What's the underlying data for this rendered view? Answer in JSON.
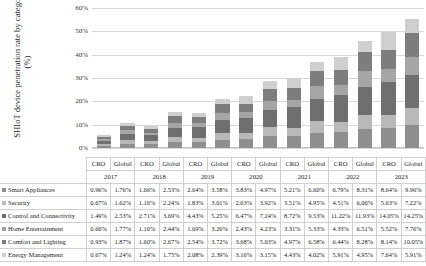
{
  "chart_data": {
    "type": "bar",
    "subtype": "stacked-column",
    "title": "",
    "xlabel": "",
    "ylabel": "SHIoT device penetration rate by categories (%)",
    "ylim": [
      0,
      60
    ],
    "ytick_labels": [
      "0%",
      "10%",
      "20%",
      "30%",
      "40%",
      "50%",
      "60%"
    ],
    "ytick_values": [
      0,
      10,
      20,
      30,
      40,
      50,
      60
    ],
    "grid": true,
    "legend_position": "table-row-labels",
    "years": [
      "2017",
      "2018",
      "2019",
      "2020",
      "2021",
      "2022",
      "2023"
    ],
    "group_labels": [
      "CRO",
      "Global"
    ],
    "categories": [
      "CRO 2017",
      "Global 2017",
      "CRO 2018",
      "Global 2018",
      "CRO 2019",
      "Global 2019",
      "CRO 2020",
      "Global 2020",
      "CRO 2021",
      "Global 2021",
      "CRO 2022",
      "Global 2022",
      "CRO 2023",
      "Global 2023"
    ],
    "series": [
      {
        "name": "Smart Appliances",
        "color": "#8e8e8e",
        "values": [
          0.96,
          1.76,
          1.66,
          2.53,
          2.64,
          3.58,
          3.83,
          4.97,
          5.21,
          6.6,
          6.79,
          8.31,
          8.64,
          9.96
        ],
        "value_labels": [
          "0.96%",
          "1.76%",
          "1.66%",
          "2.53%",
          "2.64%",
          "3.58%",
          "3.83%",
          "4.97%",
          "5.21%",
          "6.60%",
          "6.79%",
          "8.31%",
          "8.64%",
          "9.96%"
        ]
      },
      {
        "name": "Security",
        "color": "#b9b9b9",
        "values": [
          0.67,
          1.62,
          1.16,
          2.24,
          1.83,
          3.01,
          2.63,
          3.92,
          3.51,
          4.95,
          4.51,
          6.06,
          5.63,
          7.22
        ],
        "value_labels": [
          "0.67%",
          "1.62%",
          "1.16%",
          "2.24%",
          "1.83%",
          "3.01%",
          "2.63%",
          "3.92%",
          "3.51%",
          "4.95%",
          "4.51%",
          "6.06%",
          "5.63%",
          "7.22%"
        ]
      },
      {
        "name": "Control and Connectivity",
        "color": "#6f6f6f",
        "values": [
          1.49,
          2.53,
          2.71,
          3.69,
          4.43,
          5.25,
          6.47,
          7.24,
          8.72,
          9.53,
          11.22,
          11.93,
          14.05,
          14.25
        ],
        "value_labels": [
          "1.49%",
          "2.53%",
          "2.71%",
          "3.69%",
          "4.43%",
          "5.25%",
          "6.47%",
          "7.24%",
          "8.72%",
          "9.53%",
          "11.22%",
          "11.93%",
          "14.05%",
          "14.25%"
        ]
      },
      {
        "name": "Home Entertainment",
        "color": "#a5a5a5",
        "values": [
          0.66,
          1.77,
          1.1,
          2.44,
          1.69,
          3.26,
          2.43,
          4.23,
          3.31,
          5.33,
          4.33,
          6.51,
          5.52,
          7.76
        ],
        "value_labels": [
          "0.66%",
          "1.77%",
          "1.10%",
          "2.44%",
          "1.69%",
          "3.26%",
          "2.43%",
          "4.23%",
          "3.31%",
          "5.33%",
          "4.33%",
          "6.51%",
          "5.52%",
          "7.76%"
        ]
      },
      {
        "name": "Comfort and Lighting",
        "color": "#7d7d7d",
        "values": [
          0.93,
          1.87,
          1.6,
          2.67,
          2.54,
          3.72,
          3.68,
          5.03,
          4.97,
          6.58,
          6.44,
          8.28,
          8.14,
          10.05
        ],
        "value_labels": [
          "0.93%",
          "1.87%",
          "1.60%",
          "2.67%",
          "2.54%",
          "3.72%",
          "3.68%",
          "5.03%",
          "4.97%",
          "6.58%",
          "6.44%",
          "8.28%",
          "8.14%",
          "10.05%"
        ]
      },
      {
        "name": "Energy Management",
        "color": "#cfcfcf",
        "values": [
          0.67,
          1.24,
          1.24,
          1.75,
          2.08,
          2.39,
          3.16,
          3.15,
          4.43,
          4.02,
          5.91,
          4.95,
          7.64,
          5.91
        ],
        "value_labels": [
          "0.67%",
          "1.24%",
          "1.24%",
          "1.75%",
          "2.08%",
          "2.39%",
          "3.16%",
          "3.15%",
          "4.43%",
          "4.02%",
          "5.91%",
          "4.95%",
          "7.64%",
          "5.91%"
        ]
      }
    ]
  }
}
